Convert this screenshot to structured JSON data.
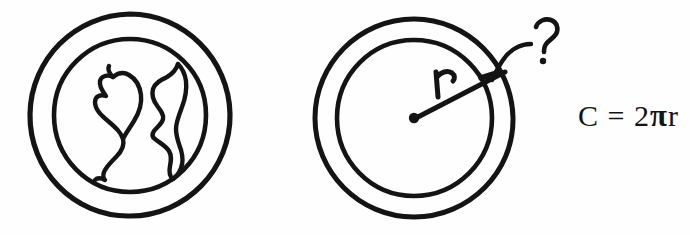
{
  "diagram": {
    "title": "Circumference of a circle illustrated with a globe",
    "background_color": "#fefefe",
    "ink_color": "#141414",
    "figures": [
      {
        "name": "globe",
        "description": "Hand-drawn Earth globe: two concentric circles with continent outlines inside",
        "center": [
          130,
          115
        ],
        "outer_radius": 100,
        "inner_radius": 76
      },
      {
        "name": "circle-with-radius",
        "description": "Hand-drawn circle: two concentric circles with a radius line from the center dot",
        "center": [
          414,
          118
        ],
        "outer_radius": 99,
        "inner_radius": 78,
        "radius_label": "r",
        "annotation_label": "?"
      }
    ],
    "labels": {
      "radius": "r",
      "question": "?"
    },
    "formula": {
      "lhs": "C",
      "equals": "=",
      "coefficient": "2",
      "pi": "π",
      "radius_symbol": "r",
      "full": "C = 2πr"
    }
  }
}
